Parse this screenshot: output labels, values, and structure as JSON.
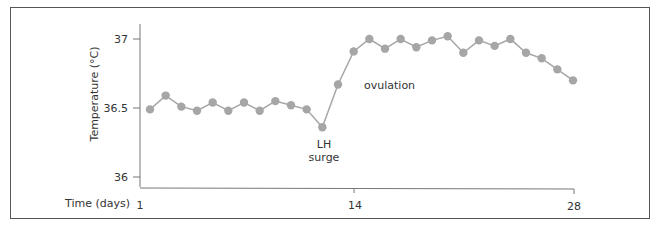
{
  "chart_data": {
    "type": "line",
    "title": "",
    "xlabel": "Time (days)",
    "ylabel": "Temperature (°C)",
    "ylim": [
      36.0,
      37.0
    ],
    "xlim": [
      1,
      28
    ],
    "grid": false,
    "legend": null,
    "y_ticks": [
      "37",
      "36.5",
      "36"
    ],
    "x_ticks": [
      "1",
      "14",
      "28"
    ],
    "x": [
      1,
      2,
      3,
      4,
      5,
      6,
      7,
      8,
      9,
      10,
      11,
      12,
      13,
      14,
      15,
      16,
      17,
      18,
      19,
      20,
      21,
      22,
      23,
      24,
      25,
      26,
      27,
      28
    ],
    "series": [
      {
        "name": "Basal body temperature",
        "color": "#a6a6a6",
        "values": [
          36.49,
          36.59,
          36.51,
          36.48,
          36.54,
          36.48,
          36.54,
          36.48,
          36.55,
          36.52,
          36.49,
          36.36,
          36.67,
          36.91,
          37.0,
          36.93,
          37.0,
          36.94,
          36.99,
          37.02,
          36.9,
          36.99,
          36.95,
          37.0,
          36.9,
          36.86,
          36.78,
          36.7
        ]
      }
    ],
    "annotations": [
      {
        "text_line1": "LH",
        "text_line2": "surge",
        "at_day": 12
      },
      {
        "text": "ovulation",
        "at_day": 13
      }
    ]
  },
  "labels": {
    "y37": "37",
    "y365": "36.5",
    "y36": "36",
    "x1": "1",
    "x14": "14",
    "x28": "28",
    "xaxis_title": "Time (days)",
    "yaxis_title": "Temperature (°C)",
    "lh_line1": "LH",
    "lh_line2": "surge",
    "ovulation": "ovulation"
  }
}
